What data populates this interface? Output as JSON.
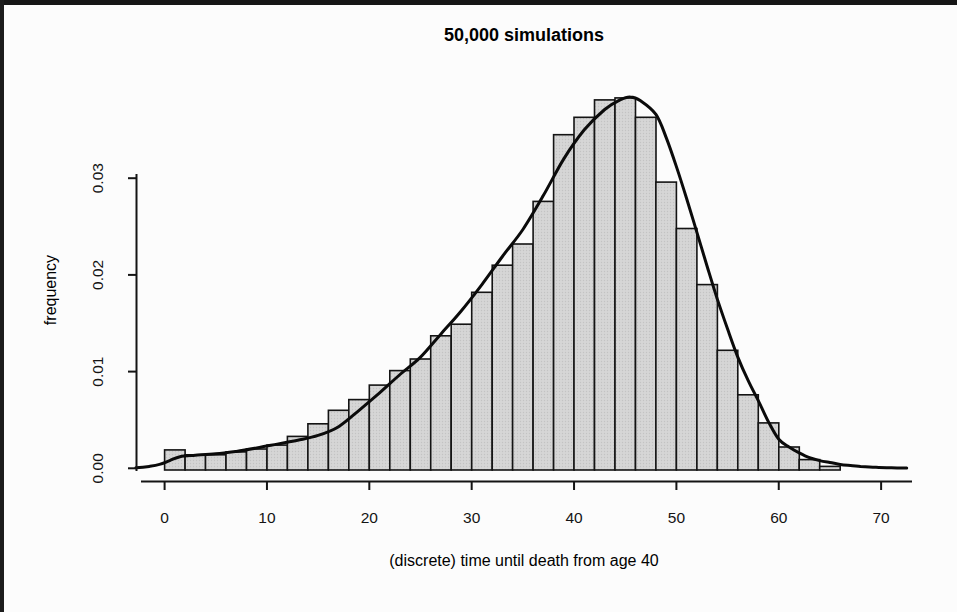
{
  "page": {
    "background": "#fcfcfc",
    "edge_color": "#161616"
  },
  "chart_data": {
    "type": "bar",
    "subtype": "histogram_with_density_curve",
    "title": "50,000 simulations",
    "xlabel": "(discrete) time until death from age 40",
    "ylabel": "frequency",
    "grid": false,
    "legend": "none",
    "xlim": [
      -3.5,
      73.5
    ],
    "ylim": [
      0,
      0.0385
    ],
    "x_ticks": {
      "values": [
        0,
        10,
        20,
        30,
        40,
        50,
        60,
        70
      ],
      "labels": [
        "0",
        "10",
        "20",
        "30",
        "40",
        "50",
        "60",
        "70"
      ]
    },
    "y_ticks": {
      "values": [
        0,
        0.01,
        0.02,
        0.03
      ],
      "labels": [
        "0.00",
        "0.01",
        "0.02",
        "0.03"
      ]
    },
    "bin_width": 2,
    "bins": {
      "starts": [
        0,
        2,
        4,
        6,
        8,
        10,
        12,
        14,
        16,
        18,
        20,
        22,
        24,
        26,
        28,
        30,
        32,
        34,
        36,
        38,
        40,
        42,
        44,
        46,
        48,
        50,
        52,
        54,
        56,
        58,
        60,
        62,
        64
      ],
      "heights": [
        0.0019,
        0.0014,
        0.0014,
        0.0017,
        0.002,
        0.0024,
        0.0033,
        0.0046,
        0.006,
        0.0071,
        0.0086,
        0.0101,
        0.0113,
        0.0137,
        0.0149,
        0.0182,
        0.021,
        0.0232,
        0.0276,
        0.0345,
        0.0363,
        0.0381,
        0.0383,
        0.0363,
        0.0296,
        0.0248,
        0.019,
        0.0122,
        0.0076,
        0.0047,
        0.0022,
        0.0009,
        0.0002
      ]
    },
    "curve": {
      "name": "density",
      "points": [
        [
          -2.8,
          5e-05
        ],
        [
          -1.5,
          0.0002
        ],
        [
          -0.5,
          0.0004
        ],
        [
          0.5,
          0.0008
        ],
        [
          1.5,
          0.0012
        ],
        [
          3,
          0.00135
        ],
        [
          5,
          0.0015
        ],
        [
          7,
          0.00175
        ],
        [
          9,
          0.0021
        ],
        [
          11,
          0.0025
        ],
        [
          13,
          0.0029
        ],
        [
          15,
          0.0034
        ],
        [
          17,
          0.0043
        ],
        [
          19,
          0.006
        ],
        [
          21,
          0.0078
        ],
        [
          23,
          0.0097
        ],
        [
          25,
          0.0115
        ],
        [
          27,
          0.0139
        ],
        [
          29,
          0.0163
        ],
        [
          31,
          0.019
        ],
        [
          33,
          0.0219
        ],
        [
          35,
          0.0247
        ],
        [
          37,
          0.0282
        ],
        [
          39,
          0.032
        ],
        [
          41,
          0.035
        ],
        [
          43,
          0.0371
        ],
        [
          44.5,
          0.0381
        ],
        [
          45.5,
          0.0384
        ],
        [
          46.5,
          0.038
        ],
        [
          48,
          0.0366
        ],
        [
          49,
          0.0342
        ],
        [
          50,
          0.0312
        ],
        [
          51,
          0.0279
        ],
        [
          52,
          0.0244
        ],
        [
          53,
          0.0209
        ],
        [
          54,
          0.0175
        ],
        [
          55,
          0.0144
        ],
        [
          56,
          0.0115
        ],
        [
          57,
          0.0091
        ],
        [
          58,
          0.007
        ],
        [
          59,
          0.0048
        ],
        [
          60,
          0.003
        ],
        [
          61,
          0.0022
        ],
        [
          62,
          0.0016
        ],
        [
          63,
          0.0011
        ],
        [
          64,
          0.0008
        ],
        [
          65,
          0.0006
        ],
        [
          66,
          0.0004
        ],
        [
          67,
          0.0003
        ],
        [
          68,
          0.0002
        ],
        [
          69.5,
          0.0001
        ],
        [
          71,
          5e-05
        ],
        [
          72.5,
          2e-05
        ]
      ]
    },
    "colors": {
      "bar_fill": "#d6d6d6",
      "bar_dot": "#c3c3c3",
      "bar_stroke": "#141414",
      "curve": "#0b0b0b",
      "axis": "#141414",
      "text": "#141414"
    }
  }
}
